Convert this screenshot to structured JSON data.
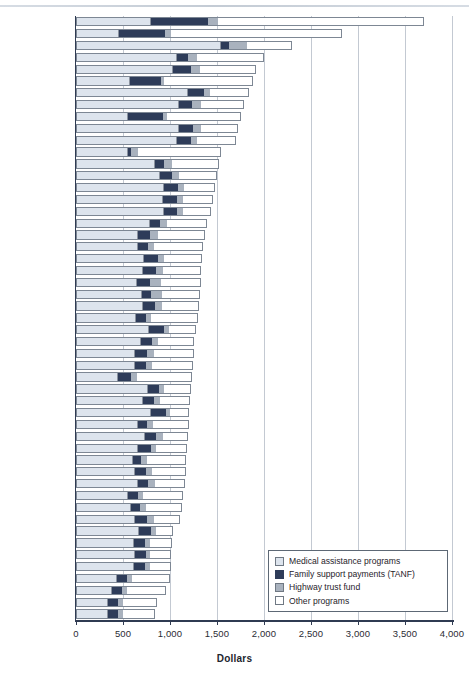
{
  "chart_data": {
    "type": "bar",
    "title": "",
    "subtitle": "",
    "orientation": "horizontal",
    "stacked": true,
    "xlabel": "Dollars",
    "ylabel": "",
    "xlim": [
      0,
      4000
    ],
    "xticks": [
      0,
      500,
      1000,
      1500,
      2000,
      2500,
      3000,
      3500,
      4000
    ],
    "xticklabels": [
      "0",
      "500",
      "1,000",
      "1,500",
      "2,000",
      "2,500",
      "3,000",
      "3,500",
      "4,000"
    ],
    "grid": true,
    "grid_axis": "x",
    "legend_position": "bottom-right",
    "series": [
      {
        "name": "Medical assistance programs",
        "key": "medical",
        "color": "#dde4ed"
      },
      {
        "name": "Family support payments (TANF)",
        "key": "tanf",
        "color": "#2e3c59"
      },
      {
        "name": "Highway trust fund",
        "key": "highway",
        "color": "#a9b2be"
      },
      {
        "name": "Other programs",
        "key": "other",
        "color": "#ffffff"
      }
    ],
    "categories": [
      "Alaska",
      "Wyoming",
      "New York",
      "New Mexico",
      "Vermont",
      "North Dakota",
      "Maine",
      "West Virginia",
      "South Dakota",
      "Rhode Island",
      "Mississippi",
      "Montana",
      "Massachusetts",
      "Kentucky",
      "Louisiana",
      "Arkansas",
      "Tennessee",
      "Pennsylvania",
      "Oklahoma",
      "Oregon",
      "Alabama",
      "U.S. Average",
      "California",
      "Connecticut",
      "Arizona",
      "Delaware",
      "Missouri",
      "Wisconsin",
      "Washington",
      "Idaho",
      "Hawaii",
      "North Carolina",
      "Nebraska",
      "South Carolina",
      "New Jersey",
      "Ohio",
      "Iowa",
      "Maryland",
      "Michigan",
      "Minnesota",
      "New Hampshire",
      "Illinois",
      "Texas",
      "Georgia",
      "Indiana",
      "Florida",
      "Kansas",
      "Utah",
      "Colorado",
      "Nevada",
      "Virginia"
    ],
    "highlight_category": "U.S. Average",
    "rows": [
      {
        "state": "Alaska",
        "medical": 790,
        "tanf": 600,
        "highway": 105,
        "other": 2205,
        "total": 3700
      },
      {
        "state": "Wyoming",
        "medical": 450,
        "tanf": 490,
        "highway": 55,
        "other": 1830,
        "total": 2825
      },
      {
        "state": "New York",
        "medical": 1530,
        "tanf": 90,
        "highway": 190,
        "other": 490,
        "total": 2300
      },
      {
        "state": "New Mexico",
        "medical": 1060,
        "tanf": 120,
        "highway": 95,
        "other": 720,
        "total": 1995
      },
      {
        "state": "Vermont",
        "medical": 1020,
        "tanf": 195,
        "highway": 95,
        "other": 600,
        "total": 1910
      },
      {
        "state": "North Dakota",
        "medical": 560,
        "tanf": 330,
        "highway": 40,
        "other": 950,
        "total": 1880
      },
      {
        "state": "Maine",
        "medical": 1180,
        "tanf": 170,
        "highway": 60,
        "other": 430,
        "total": 1840
      },
      {
        "state": "West Virginia",
        "medical": 1080,
        "tanf": 145,
        "highway": 90,
        "other": 475,
        "total": 1790
      },
      {
        "state": "South Dakota",
        "medical": 540,
        "tanf": 370,
        "highway": 45,
        "other": 800,
        "total": 1755
      },
      {
        "state": "Rhode Island",
        "medical": 1085,
        "tanf": 150,
        "highway": 80,
        "other": 410,
        "total": 1725
      },
      {
        "state": "Mississippi",
        "medical": 1060,
        "tanf": 155,
        "highway": 65,
        "other": 420,
        "total": 1700
      },
      {
        "state": "Montana",
        "medical": 545,
        "tanf": 30,
        "highway": 75,
        "other": 890,
        "total": 1540
      },
      {
        "state": "Massachusetts",
        "medical": 830,
        "tanf": 100,
        "highway": 85,
        "other": 505,
        "total": 1520
      },
      {
        "state": "Kentucky",
        "medical": 880,
        "tanf": 130,
        "highway": 70,
        "other": 425,
        "total": 1505
      },
      {
        "state": "Louisiana",
        "medical": 925,
        "tanf": 145,
        "highway": 65,
        "other": 345,
        "total": 1480
      },
      {
        "state": "Arkansas",
        "medical": 915,
        "tanf": 150,
        "highway": 65,
        "other": 330,
        "total": 1460
      },
      {
        "state": "Tennessee",
        "medical": 925,
        "tanf": 135,
        "highway": 65,
        "other": 310,
        "total": 1435
      },
      {
        "state": "Pennsylvania",
        "medical": 775,
        "tanf": 105,
        "highway": 75,
        "other": 440,
        "total": 1395
      },
      {
        "state": "Oklahoma",
        "medical": 650,
        "tanf": 130,
        "highway": 80,
        "other": 510,
        "total": 1370
      },
      {
        "state": "Oregon",
        "medical": 650,
        "tanf": 110,
        "highway": 60,
        "other": 535,
        "total": 1355
      },
      {
        "state": "Alabama",
        "medical": 715,
        "tanf": 150,
        "highway": 60,
        "other": 420,
        "total": 1345
      },
      {
        "state": "U.S. Average",
        "medical": 700,
        "tanf": 140,
        "highway": 70,
        "other": 425,
        "total": 1335
      },
      {
        "state": "California",
        "medical": 640,
        "tanf": 135,
        "highway": 115,
        "other": 440,
        "total": 1330
      },
      {
        "state": "Connecticut",
        "medical": 690,
        "tanf": 100,
        "highway": 115,
        "other": 415,
        "total": 1320
      },
      {
        "state": "Arizona",
        "medical": 705,
        "tanf": 125,
        "highway": 70,
        "other": 410,
        "total": 1310
      },
      {
        "state": "Delaware",
        "medical": 630,
        "tanf": 100,
        "highway": 55,
        "other": 510,
        "total": 1295
      },
      {
        "state": "Missouri",
        "medical": 770,
        "tanf": 155,
        "highway": 55,
        "other": 295,
        "total": 1275
      },
      {
        "state": "Wisconsin",
        "medical": 680,
        "tanf": 120,
        "highway": 65,
        "other": 395,
        "total": 1260
      },
      {
        "state": "Washington",
        "medical": 620,
        "tanf": 125,
        "highway": 75,
        "other": 430,
        "total": 1250
      },
      {
        "state": "Idaho",
        "medical": 615,
        "tanf": 115,
        "highway": 70,
        "other": 445,
        "total": 1245
      },
      {
        "state": "Hawaii",
        "medical": 435,
        "tanf": 135,
        "highway": 65,
        "other": 600,
        "total": 1235
      },
      {
        "state": "North Carolina",
        "medical": 755,
        "tanf": 120,
        "highway": 55,
        "other": 290,
        "total": 1220
      },
      {
        "state": "Nebraska",
        "medical": 700,
        "tanf": 120,
        "highway": 65,
        "other": 325,
        "total": 1210
      },
      {
        "state": "South Carolina",
        "medical": 790,
        "tanf": 155,
        "highway": 45,
        "other": 215,
        "total": 1205
      },
      {
        "state": "New Jersey",
        "medical": 650,
        "tanf": 95,
        "highway": 60,
        "other": 395,
        "total": 1200
      },
      {
        "state": "Ohio",
        "medical": 720,
        "tanf": 125,
        "highway": 70,
        "other": 275,
        "total": 1190
      },
      {
        "state": "Iowa",
        "medical": 650,
        "tanf": 135,
        "highway": 60,
        "other": 340,
        "total": 1185
      },
      {
        "state": "Maryland",
        "medical": 595,
        "tanf": 90,
        "highway": 65,
        "other": 425,
        "total": 1175
      },
      {
        "state": "Michigan",
        "medical": 620,
        "tanf": 110,
        "highway": 70,
        "other": 365,
        "total": 1165
      },
      {
        "state": "Minnesota",
        "medical": 650,
        "tanf": 105,
        "highway": 70,
        "other": 330,
        "total": 1155
      },
      {
        "state": "New Hampshire",
        "medical": 540,
        "tanf": 105,
        "highway": 60,
        "other": 435,
        "total": 1140
      },
      {
        "state": "Illinois",
        "medical": 570,
        "tanf": 95,
        "highway": 70,
        "other": 395,
        "total": 1130
      },
      {
        "state": "Texas",
        "medical": 615,
        "tanf": 130,
        "highway": 70,
        "other": 290,
        "total": 1105
      },
      {
        "state": "Georgia",
        "medical": 655,
        "tanf": 135,
        "highway": 55,
        "other": 190,
        "total": 1035
      },
      {
        "state": "Indiana",
        "medical": 605,
        "tanf": 115,
        "highway": 55,
        "other": 250,
        "total": 1025
      },
      {
        "state": "Florida",
        "medical": 615,
        "tanf": 115,
        "highway": 50,
        "other": 235,
        "total": 1015
      },
      {
        "state": "Kansas",
        "medical": 605,
        "tanf": 120,
        "highway": 55,
        "other": 235,
        "total": 1015
      },
      {
        "state": "Utah",
        "medical": 425,
        "tanf": 110,
        "highway": 55,
        "other": 405,
        "total": 995
      },
      {
        "state": "Colorado",
        "medical": 370,
        "tanf": 105,
        "highway": 55,
        "other": 425,
        "total": 955
      },
      {
        "state": "Nevada",
        "medical": 330,
        "tanf": 105,
        "highway": 55,
        "other": 375,
        "total": 865
      },
      {
        "state": "Virginia",
        "medical": 330,
        "tanf": 110,
        "highway": 50,
        "other": 355,
        "total": 845
      }
    ]
  },
  "legend": {
    "items": [
      {
        "label": "Medical assistance programs",
        "swatch": "medical"
      },
      {
        "label": "Family support payments (TANF)",
        "swatch": "tanf"
      },
      {
        "label": "Highway trust fund",
        "swatch": "highway"
      },
      {
        "label": "Other programs",
        "swatch": "other"
      }
    ]
  },
  "axis": {
    "x_title": "Dollars"
  }
}
